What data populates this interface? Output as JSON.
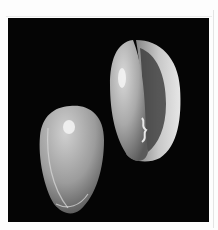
{
  "image": {
    "subject": "Two seashells on black background",
    "background_color": "#050505",
    "frame_color": "#fdfdfd",
    "shells": [
      {
        "id": "right-shell",
        "view": "aperture",
        "tone": "light gray"
      },
      {
        "id": "left-shell",
        "view": "dorsal",
        "tone": "light gray"
      }
    ]
  }
}
